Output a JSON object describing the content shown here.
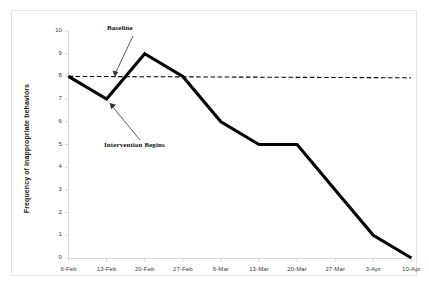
{
  "chart_data": {
    "type": "line",
    "title": "",
    "xlabel": "",
    "ylabel": "Frequency of inappropriate behaviors",
    "categories": [
      "6-Feb",
      "13-Feb",
      "20-Feb",
      "27-Feb",
      "6-Mar",
      "13-Mar",
      "20-Mar",
      "27-Mar",
      "3-Apr",
      "10-Apr"
    ],
    "values": [
      8,
      7,
      9,
      8,
      6,
      5,
      5,
      3,
      1,
      0
    ],
    "ylim": [
      0,
      10
    ],
    "yticks": [
      0,
      1,
      2,
      3,
      4,
      5,
      6,
      7,
      8,
      9,
      10
    ],
    "ytick_labels": [
      "0",
      "1",
      "2",
      "3",
      "4",
      "5",
      "6",
      "7",
      "8",
      "9",
      "10"
    ],
    "grid": false,
    "legend": "none",
    "series": [
      {
        "name": "Frequency of inappropriate behaviors",
        "values": [
          8,
          7,
          9,
          8,
          6,
          5,
          5,
          3,
          1,
          0
        ],
        "color": "#000000",
        "style": "solid"
      },
      {
        "name": "Baseline",
        "value": 8,
        "color": "#000000",
        "style": "dashed"
      }
    ],
    "annotations": [
      {
        "text": "Baseline",
        "target_x": "20-Feb",
        "target_y": 8
      },
      {
        "text": "Intervention Begins",
        "target_x": "13-Feb",
        "target_y": 7
      }
    ]
  },
  "axis": {
    "y_title": "Frequency of inappropriate behaviors",
    "y_labels": [
      "10",
      "9",
      "8",
      "7",
      "6",
      "5",
      "4",
      "3",
      "2",
      "1",
      "0"
    ],
    "x_labels": [
      "6-Feb",
      "13-Feb",
      "20-Feb",
      "27-Feb",
      "6-Mar",
      "13-Mar",
      "20-Mar",
      "27-Mar",
      "3-Apr",
      "10-Apr"
    ]
  },
  "annotations": {
    "baseline": "Baseline",
    "intervention": "Intervention Begins"
  },
  "colors": {
    "line": "#000000",
    "baseline": "#000000",
    "axis": "#d9d9d9",
    "frame": "#e3e3e3",
    "text": "#3a3a3a",
    "background": "#ffffff"
  }
}
